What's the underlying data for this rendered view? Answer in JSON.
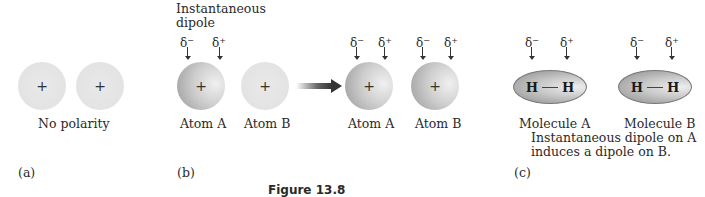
{
  "figure": {
    "caption": "Figure 13.8",
    "panels": {
      "a": {
        "label": "(a)",
        "caption": "No polarity",
        "atoms": [
          {
            "name": "atom-1",
            "charge_symbol": "+"
          },
          {
            "name": "atom-2",
            "charge_symbol": "+"
          }
        ]
      },
      "b": {
        "label": "(b)",
        "title_line1": "Instantaneous",
        "title_line2": "dipole",
        "left": {
          "delta_neg": "δ",
          "delta_neg_sup": "−",
          "delta_pos": "δ",
          "delta_pos_sup": "+",
          "atom_a_label": "Atom A",
          "atom_b_label": "Atom B",
          "charge_symbol": "+"
        },
        "right": {
          "atom_a_label": "Atom A",
          "atom_b_label": "Atom B",
          "charge_symbol": "+"
        }
      },
      "c": {
        "label": "(c)",
        "molecule_a_label": "Molecule A",
        "molecule_b_label": "Molecule B",
        "atom_symbol": "H",
        "description_line1": "Instantaneous dipole on A",
        "description_line2": "induces a dipole on B."
      }
    },
    "delta_neg": "δ",
    "delta_neg_sup": "−",
    "delta_pos": "δ",
    "delta_pos_sup": "+"
  }
}
